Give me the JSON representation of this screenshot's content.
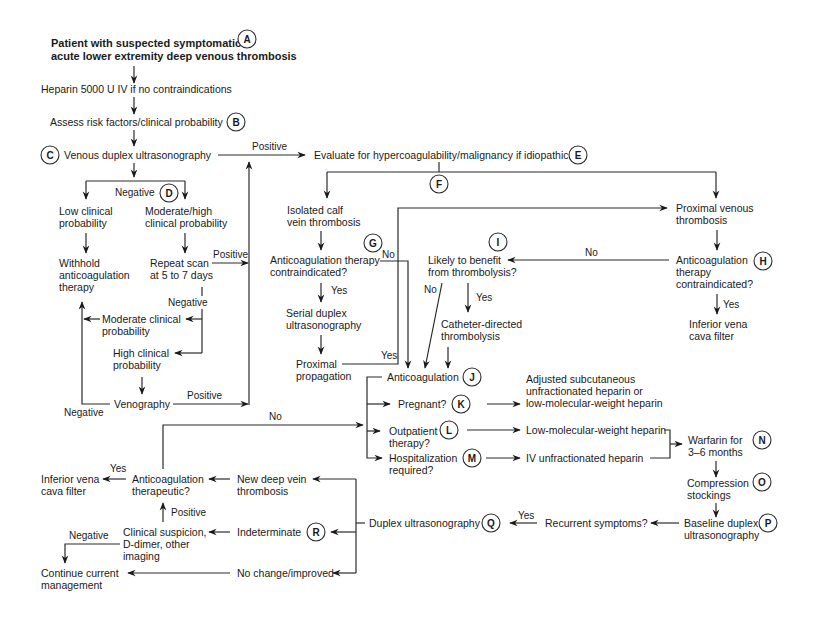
{
  "title": "Patient with suspected symptomatic acute lower extremity deep venous thrombosis",
  "nodes": {
    "start_l1": "Patient with suspected symptomatic",
    "start_l2": "acute lower extremity deep venous thrombosis",
    "heparin": "Heparin 5000 U IV if no contraindications",
    "assess": "Assess risk factors/clinical probability",
    "duplex": "Venous duplex ultrasonography",
    "evaluate": "Evaluate for hypercoagulability/malignancy if idiopathic",
    "low_l1": "Low clinical",
    "low_l2": "probability",
    "modhigh_l1": "Moderate/high",
    "modhigh_l2": "clinical probability",
    "withhold_l1": "Withhold",
    "withhold_l2": "anticoagulation",
    "withhold_l3": "therapy",
    "repeat_l1": "Repeat scan",
    "repeat_l2": "at 5 to 7 days",
    "modclin_l1": "Moderate clinical",
    "modclin_l2": "probability",
    "highclin_l1": "High clinical",
    "highclin_l2": "probability",
    "venography": "Venography",
    "calf_l1": "Isolated calf",
    "calf_l2": "vein thrombosis",
    "ac_contra_l1": "Anticoagulation therapy",
    "ac_contra_l2": "contraindicated?",
    "serial_l1": "Serial duplex",
    "serial_l2": "ultrasonography",
    "prox_prop_l1": "Proximal",
    "prox_prop_l2": "propagation",
    "likely_l1": "Likely to benefit",
    "likely_l2": "from thrombolysis?",
    "catheter_l1": "Catheter-directed",
    "catheter_l2": "thrombolysis",
    "proximal_l1": "Proximal venous",
    "proximal_l2": "thrombosis",
    "h_contra_l1": "Anticoagulation",
    "h_contra_l2": "therapy",
    "h_contra_l3": "contraindicated?",
    "ivc_l1": "Inferior vena",
    "ivc_l2": "cava filter",
    "anticoag": "Anticoagulation",
    "pregnant": "Pregnant?",
    "outpatient_l1": "Outpatient",
    "outpatient_l2": "therapy?",
    "hosp_l1": "Hospitalization",
    "hosp_l2": "required?",
    "adjusted_l1": "Adjusted subcutaneous",
    "adjusted_l2": "unfractionated heparin or",
    "adjusted_l3": "low-molecular-weight heparin",
    "lmwh": "Low-molecular-weight heparin",
    "ivufh": "IV unfractionated heparin",
    "warfarin_l1": "Warfarin for",
    "warfarin_l2": "3–6 months",
    "compression_l1": "Compression",
    "compression_l2": "stockings",
    "baseline_l1": "Baseline duplex",
    "baseline_l2": "ultrasonography",
    "recurrent": "Recurrent symptoms?",
    "duplex2": "Duplex ultrasonography",
    "newdvt_l1": "New deep vein",
    "newdvt_l2": "thrombosis",
    "indeterminate": "Indeterminate",
    "nochange": "No change/improved",
    "ac_thera_l1": "Anticoagulation",
    "ac_thera_l2": "therapeutic?",
    "ivc2_l1": "Inferior vena",
    "ivc2_l2": "cava filter",
    "clinsusp_l1": "Clinical suspicion,",
    "clinsusp_l2": "D-dimer, other",
    "clinsusp_l3": "imaging",
    "continue_l1": "Continue current",
    "continue_l2": "management"
  },
  "edge_labels": {
    "positive_c": "Positive",
    "negative_d": "Negative",
    "positive_repeat": "Positive",
    "negative_repeat": "Negative",
    "positive_veno": "Positive",
    "negative_veno": "Negative",
    "no_g": "No",
    "yes_g": "Yes",
    "yes_prop": "Yes",
    "no_i": "No",
    "yes_i": "Yes",
    "no_h": "No",
    "yes_h": "Yes",
    "no_thera": "No",
    "yes_thera": "Yes",
    "positive_clin": "Positive",
    "negative_clin": "Negative",
    "yes_recurrent": "Yes"
  },
  "badges": [
    "A",
    "B",
    "C",
    "D",
    "E",
    "F",
    "G",
    "H",
    "I",
    "J",
    "K",
    "L",
    "M",
    "N",
    "O",
    "P",
    "Q",
    "R"
  ]
}
